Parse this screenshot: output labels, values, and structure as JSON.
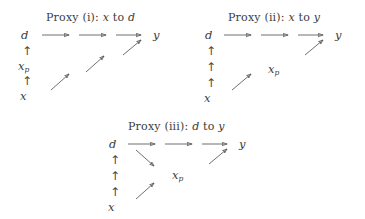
{
  "figure": {
    "background_color": "#ffffff",
    "ink_color": "#3b3b3b",
    "arrow_color": "#555555",
    "width": 365,
    "height": 219
  },
  "panels": [
    {
      "id": "proxy-i",
      "title_prefix": "Proxy (i): ",
      "title_from": "x",
      "title_mid": " to ",
      "title_to": "d",
      "title_full": "Proxy (i): x to d",
      "column_nodes": [
        "d",
        "x_p",
        "x"
      ],
      "column_labels": [
        "d",
        "xp",
        "x"
      ],
      "sink_node": "y",
      "vertical_ticks": 2,
      "tick_glyph": "↑",
      "horizontal_arrows": 3,
      "diagonal_arrows": 3,
      "diagonal_direction": "up-right"
    },
    {
      "id": "proxy-ii",
      "title_prefix": "Proxy (ii): ",
      "title_from": "x",
      "title_mid": " to ",
      "title_to": "y",
      "title_full": "Proxy (ii): x to y",
      "column_nodes": [
        "d",
        "x"
      ],
      "column_labels": [
        "d",
        "x"
      ],
      "floating_node": "xp",
      "sink_node": "y",
      "vertical_ticks": 3,
      "tick_glyph": "↑",
      "horizontal_arrows": 3,
      "diagonal_arrows": 2,
      "diagonal_direction": "up-right"
    },
    {
      "id": "proxy-iii",
      "title_prefix": "Proxy (iii): ",
      "title_from": "d",
      "title_mid": " to ",
      "title_to": "y",
      "title_full": "Proxy (iii): d to y",
      "column_nodes": [
        "d",
        "x"
      ],
      "column_labels": [
        "d",
        "x"
      ],
      "floating_node": "xp",
      "sink_node": "y",
      "vertical_ticks": 3,
      "tick_glyph": "↑",
      "horizontal_arrows": 3,
      "diagonal_arrows_up": 2,
      "diagonal_arrows_down": 1,
      "diagonal_direction": "mixed"
    }
  ],
  "glyphs": {
    "up_arrow": "↑",
    "d": "d",
    "x": "x",
    "y": "y",
    "x_sub": "x",
    "p_sub": "p"
  }
}
